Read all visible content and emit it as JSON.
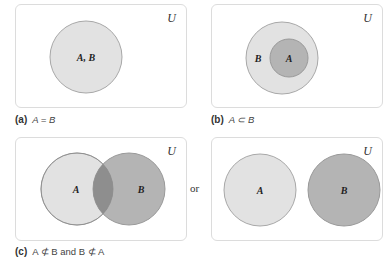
{
  "universe_label": "U",
  "panels": [
    {
      "id": "a",
      "tag": "(a)",
      "relation": "A = B",
      "sets": [
        {
          "label": "A, B",
          "color": "#e2e2e2"
        }
      ]
    },
    {
      "id": "b",
      "tag": "(b)",
      "relation": "A ⊂ B",
      "sets": [
        {
          "label": "B",
          "color": "#e2e2e2"
        },
        {
          "label": "A",
          "color": "#b4b4b4"
        }
      ]
    },
    {
      "id": "c",
      "tag": "(c)",
      "relation": "A ⊄ B and B ⊄ A",
      "variants": [
        {
          "layout": "overlapping",
          "sets": [
            {
              "label": "A",
              "color": "#e2e2e2"
            },
            {
              "label": "B",
              "color": "#b4b4b4"
            }
          ],
          "intersection_color": "#8e8e8e"
        },
        {
          "layout": "disjoint",
          "sets": [
            {
              "label": "A",
              "color": "#e2e2e2"
            },
            {
              "label": "B",
              "color": "#b4b4b4"
            }
          ]
        }
      ],
      "connector": "or"
    }
  ],
  "colors": {
    "outline": "#a8a8a8",
    "box_border": "#dcdcdc"
  }
}
